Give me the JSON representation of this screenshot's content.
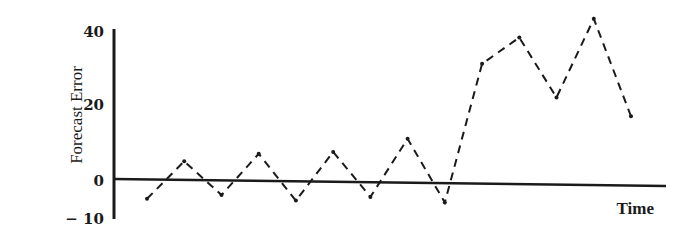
{
  "chart_data": {
    "type": "line",
    "title": "",
    "xlabel": "Time",
    "ylabel": "Forecast Error",
    "y_ticks": [
      {
        "value": 40,
        "label": "40"
      },
      {
        "value": 20,
        "label": "20"
      },
      {
        "value": 0,
        "label": "0"
      },
      {
        "value": -10,
        "label": "− 10"
      }
    ],
    "ylim": [
      -10,
      45
    ],
    "grid": false,
    "legend": null,
    "line_style": "dashed",
    "x": [
      1,
      2,
      3,
      4,
      5,
      6,
      7,
      8,
      9,
      10,
      11,
      12,
      13,
      14
    ],
    "series": [
      {
        "name": "Forecast Error",
        "values": [
          -5,
          5,
          -4,
          7,
          -5.5,
          7.5,
          -4.5,
          11,
          -6,
          31,
          38,
          22,
          43,
          17
        ]
      }
    ]
  },
  "colors": {
    "ink": "#1a1a1a",
    "background": "#ffffff"
  }
}
